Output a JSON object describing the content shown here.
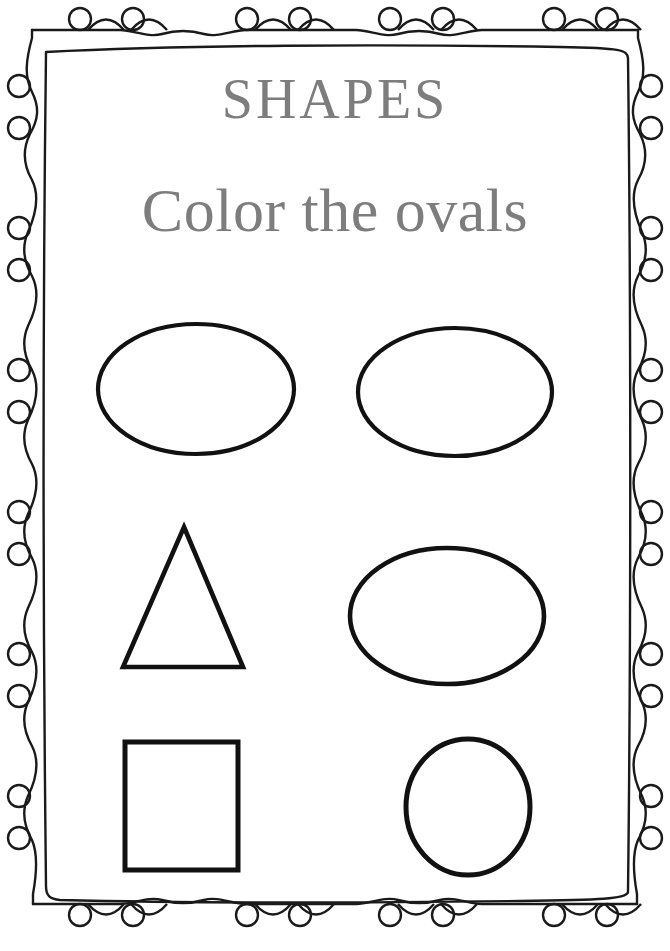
{
  "page": {
    "kind": "printable-worksheet",
    "width": 670,
    "height": 951,
    "background_color": "#ffffff"
  },
  "header": {
    "title": "SHAPES",
    "subtitle": "Color the ovals",
    "title_color": "#7d7d7d",
    "subtitle_color": "#7d7d7d"
  },
  "instruction": {
    "action": "Color",
    "target_shape": "ovals"
  },
  "border": {
    "style": "hand-drawn double frame with curled loops",
    "stroke_color": "#1a1a1a",
    "loops_top": 8,
    "loops_bottom": 8,
    "loops_left": 8,
    "loops_right": 8
  },
  "shapes": {
    "rows": [
      {
        "row_index": 1,
        "items": [
          {
            "name": "oval",
            "is_target": true,
            "cx": 196,
            "cy": 389,
            "rx": 98,
            "ry": 65,
            "stroke_width": 4.2
          },
          {
            "name": "oval",
            "is_target": true,
            "cx": 455,
            "cy": 392,
            "rx": 97,
            "ry": 64,
            "stroke_width": 4.2
          }
        ]
      },
      {
        "row_index": 2,
        "items": [
          {
            "name": "triangle",
            "is_target": false,
            "apex_x": 184,
            "apex_y": 527,
            "base_y": 667,
            "base_left_x": 123,
            "base_right_x": 243,
            "stroke_width": 4.6
          },
          {
            "name": "oval",
            "is_target": true,
            "cx": 447,
            "cy": 616,
            "rx": 97,
            "ry": 68,
            "stroke_width": 4.6
          }
        ]
      },
      {
        "row_index": 3,
        "items": [
          {
            "name": "square",
            "is_target": false,
            "x": 125,
            "y": 742,
            "width": 113,
            "height": 128,
            "stroke_width": 5.0
          },
          {
            "name": "circle",
            "is_target": true,
            "cx": 468,
            "cy": 807,
            "rx": 62,
            "ry": 68,
            "stroke_width": 5.0
          }
        ]
      }
    ],
    "target_count": 4,
    "total_count": 6
  },
  "footer": {
    "credit": ""
  }
}
